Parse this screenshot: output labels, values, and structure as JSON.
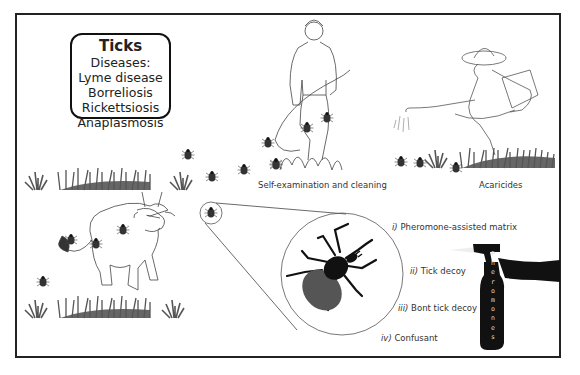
{
  "infobox": {
    "title": "Ticks",
    "subtitle": "Diseases:",
    "diseases": [
      "Lyme disease",
      "Borreliosis",
      "Rickettsiosis",
      "Anaplasmosis"
    ]
  },
  "scenes": {
    "farmer_caption": "Self-examination and cleaning",
    "sprayer_caption": "Acaricides"
  },
  "methods": [
    {
      "numeral": "i)",
      "text": "Pheromone-assisted matrix"
    },
    {
      "numeral": "ii)",
      "text": "Tick decoy"
    },
    {
      "numeral": "iii)",
      "text": "Bont tick decoy"
    },
    {
      "numeral": "iv)",
      "text": "Confusant"
    }
  ],
  "bottle": {
    "label_letters": [
      "P",
      "h",
      "e",
      "r",
      "o",
      "m",
      "o",
      "n",
      "e",
      "s"
    ]
  },
  "colors": {
    "border": "#222222",
    "tick_body": "#555555",
    "tick_scutum": "#111111",
    "grass": "#555555"
  }
}
